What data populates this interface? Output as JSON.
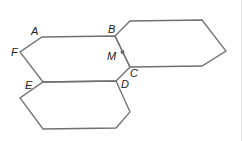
{
  "diagram": {
    "colors": {
      "stroke": "#707070",
      "label": "#222222",
      "point": "#6a6a6a"
    },
    "hexagons": [
      {
        "name": "center",
        "points": "42,37 115,36 130,67 116,81 43,82 20,52"
      },
      {
        "name": "upper-right",
        "points": "115,36 130,21 202,20 226,51 202,66 130,67"
      },
      {
        "name": "lower",
        "points": "43,82 116,81 130,112 116,128 43,129 20,98"
      }
    ],
    "labels": [
      {
        "id": "A",
        "text": "A",
        "x": 31,
        "y": 35
      },
      {
        "id": "B",
        "text": "B",
        "x": 108,
        "y": 33
      },
      {
        "id": "F",
        "text": "F",
        "x": 11,
        "y": 56
      },
      {
        "id": "M",
        "text": "M",
        "x": 107,
        "y": 60
      },
      {
        "id": "C",
        "text": "C",
        "x": 130,
        "y": 77
      },
      {
        "id": "E",
        "text": "E",
        "x": 25,
        "y": 89
      },
      {
        "id": "D",
        "text": "D",
        "x": 121,
        "y": 88
      }
    ],
    "point_M": {
      "cx": 122.5,
      "cy": 52,
      "r": 2
    }
  }
}
